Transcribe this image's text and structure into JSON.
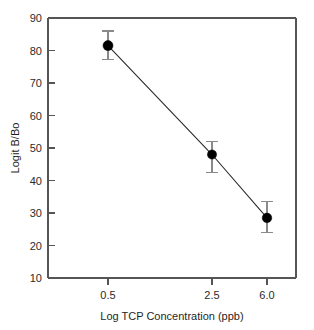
{
  "chart_data": {
    "type": "line",
    "title": "",
    "subtitle": "",
    "xlabel": "Log TCP Concentration (ppb)",
    "ylabel": "Logit B/Bo",
    "grid": false,
    "legend": "none",
    "x": [
      0.5,
      2.5,
      6.0
    ],
    "categories": [
      "0.5",
      "2.5",
      "6.0"
    ],
    "xtick_labels": [
      "0.5",
      "2.5",
      "6.0"
    ],
    "ytick_labels": [
      "10",
      "20",
      "30",
      "40",
      "50",
      "60",
      "70",
      "80",
      "90"
    ],
    "ytick_values": [
      10,
      20,
      30,
      40,
      50,
      60,
      70,
      80,
      90
    ],
    "ylim": [
      10,
      90
    ],
    "series": [
      {
        "name": "Logit B/Bo",
        "values": [
          81.5,
          48.0,
          28.5
        ],
        "error_low": [
          4.2,
          5.5,
          4.5
        ],
        "error_high": [
          4.5,
          4.0,
          5.0
        ],
        "marker": "filled-circle",
        "marker_color": "#000000",
        "line_color": "#2a2a2a",
        "errorbar_color": "#8a8a8a"
      }
    ],
    "points": [
      {
        "x_label": "0.5",
        "x": 0.5,
        "y": 81.5,
        "y_lower": 77.3,
        "y_upper": 86.0
      },
      {
        "x_label": "2.5",
        "x": 2.5,
        "y": 48.0,
        "y_lower": 42.5,
        "y_upper": 52.0
      },
      {
        "x_label": "6.0",
        "x": 6.0,
        "y": 28.5,
        "y_lower": 24.0,
        "y_upper": 33.5
      }
    ],
    "colors": {
      "background": "#ffffff",
      "axis": "#555555",
      "marker": "#000000",
      "line": "#2a2a2a",
      "errorbar": "#8a8a8a",
      "text": "#1f1f1f"
    }
  }
}
